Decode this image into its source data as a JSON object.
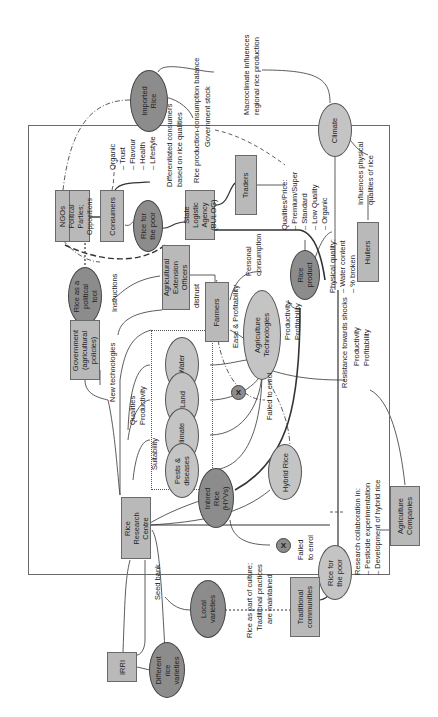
{
  "diagram": {
    "orientation": "rotated -90 degrees (text reads bottom-to-top)",
    "colors": {
      "box_fill": "#b9b9b9",
      "ellipse_light": "#c4c4c4",
      "ellipse_dark": "#8c8c8c",
      "line": "#333333"
    },
    "nodes": {
      "imported_rice": "Imported Rice",
      "climate": "Climate",
      "ngos": "NGOs",
      "political_parties": "Political Parties; Oppositions",
      "consumers": "Consumers",
      "rice_for_poor_top": "Rice for the poor",
      "state_logistic_agency": "State Logistic Agency (BULOG)",
      "traders": "Traders",
      "rice_political_tool": "Rice as a political tool",
      "agri_extension_officers": "Agricultural Extension Officers",
      "farmers": "Farmers",
      "agriculture_technologies": "Agriculture Technologies",
      "rice_product": "Rice product",
      "hullers": "Hullers",
      "government": "Government (agricultural policies)",
      "water": "Water",
      "land": "Land",
      "climate_inner": "Climate",
      "pests_diseases": "Pests & diseases",
      "inbred_rice": "Inbred Rice (HYVs)",
      "hybrid_rice": "Hybrid Rice",
      "rice_research_centre": "Rice Research Centre",
      "agriculture_companies": "Agriculture Companies",
      "x_mark_1": "X",
      "x_mark_2": "X",
      "rice_for_poor_bottom": "Rice for the poor",
      "local_varieties": "Local varieties",
      "traditional_communities": "Traditional communities",
      "irri": "IRRI",
      "different_rice_varieties": "Different rice varieties"
    },
    "labels": {
      "macroclimate": [
        "Macroclimate influences",
        "regional rice production"
      ],
      "rice_balance": [
        "Rice production-consumption balance",
        "Government stock"
      ],
      "consumer_qualities": [
        "Organic",
        "– Trust",
        "– Flavour",
        "– Health",
        "– Lifestyle"
      ],
      "differentiated_consumers": [
        "Differentiated consumers",
        "based on rice qualities"
      ],
      "qualities_price": [
        "Qualities/Price:",
        "– Premium/Super",
        "– Standard",
        "– Low Quality",
        "– Organic"
      ],
      "influences_physical": [
        "Influences physical",
        "qualities of rice"
      ],
      "physical_quality": [
        "Physical quality:",
        "– Water content",
        "– % broken"
      ],
      "personal_consumption": [
        "Personal",
        "consumption"
      ],
      "instructions": "Instructions",
      "distrust": "distrust",
      "ease_profitability": "Ease & Profitability",
      "productivity_profitability": [
        "Productivity",
        "Profitability"
      ],
      "new_technologies": "New technologies",
      "qualities_productivity": [
        "Qualities",
        "Productivity"
      ],
      "suitability": "Suitability",
      "failed_to_enrol_1": "Failed to enrol",
      "failed_to_enrol_2": [
        "Failed",
        "to enrol"
      ],
      "resistance": [
        "Resistance towards shocks",
        "Productivity",
        "Profitability"
      ],
      "research_collab": [
        "Research collaboration in:",
        "– Pesticide experimentation",
        "– Development of hybrid rice"
      ],
      "seed_bank": "Seed bank",
      "rice_culture": [
        "Rice as part of culture;",
        "Traditional practices",
        "are maintained"
      ]
    }
  }
}
